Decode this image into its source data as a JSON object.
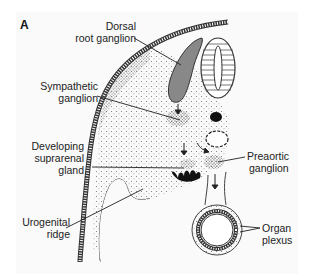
{
  "figure": {
    "panel_label": "A",
    "labels": {
      "dorsal_root_ganglion": [
        "Dorsal",
        "root ganglion"
      ],
      "sympathetic_ganglion": [
        "Sympathetic",
        "ganglion"
      ],
      "developing_suprarenal_gland": [
        "Developing",
        "suprarenal",
        "gland"
      ],
      "urogenital_ridge": [
        "Urogenital",
        "ridge"
      ],
      "preaortic_ganglion": [
        "Preaortic",
        "ganglion"
      ],
      "organ_plexus": [
        "Organ",
        "plexus"
      ]
    }
  }
}
